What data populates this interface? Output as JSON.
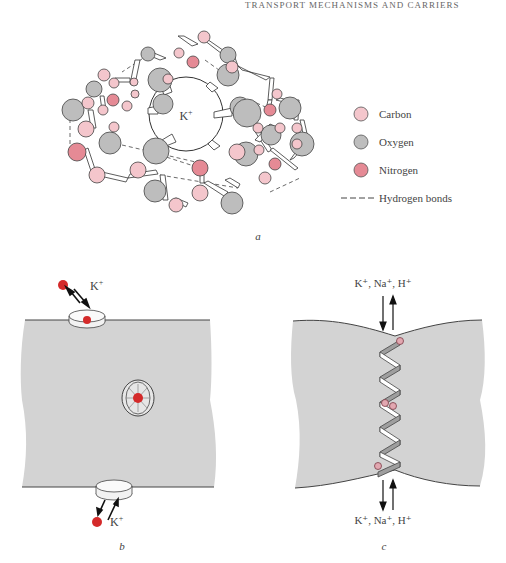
{
  "header": {
    "running_title": "TRANSPORT MECHANISMS AND CARRIERS"
  },
  "panel_a": {
    "label": "a",
    "center_ion": "K",
    "center_ion_charge": "+",
    "legend": [
      {
        "name": "Carbon",
        "color": "#f4c6cc"
      },
      {
        "name": "Oxygen",
        "color": "#bdbdbd"
      },
      {
        "name": "Nitrogen",
        "color": "#e58a95"
      },
      {
        "name": "Hydrogen bonds",
        "style": "dashed"
      }
    ]
  },
  "panel_b": {
    "label": "b",
    "top_ion": "K",
    "top_ion_charge": "+",
    "bottom_ion": "K",
    "bottom_ion_charge": "+",
    "ion_color": "#d42a2a",
    "membrane_color": "#d3d3d3"
  },
  "panel_c": {
    "label": "c",
    "top_ions": "K⁺, Na⁺, H⁺",
    "bottom_ions": "K⁺, Na⁺, H⁺",
    "membrane_color": "#d3d3d3"
  }
}
